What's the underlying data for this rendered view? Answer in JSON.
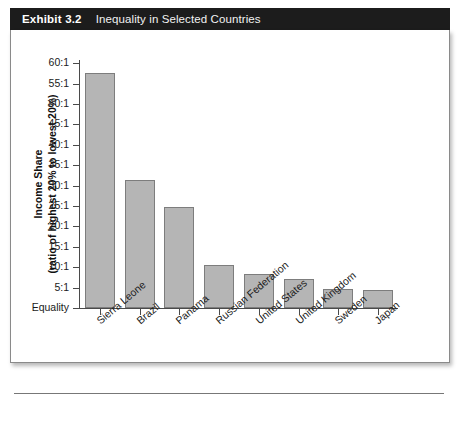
{
  "exhibit": {
    "number": "Exhibit 3.2",
    "title": "Inequality in Selected Countries"
  },
  "chart_data": {
    "type": "bar",
    "title": "Inequality in Selected Countries",
    "xlabel": "",
    "ylabel": "Income Share (ratio of highest 20% to lowest 20%)",
    "ylabel_line1": "Income Share",
    "ylabel_line2": "(ratio of highest 20% to lowest 20%)",
    "categories": [
      "Sierra Leone",
      "Brazil",
      "Panama",
      "Russian Federation",
      "United States",
      "United Kingdom",
      "Sweden",
      "Japan"
    ],
    "values": [
      57.6,
      31.5,
      24.7,
      10.5,
      8.4,
      7.2,
      4.6,
      4.3
    ],
    "ylim": [
      0,
      60
    ],
    "ytick_values": [
      0,
      5,
      10,
      15,
      20,
      25,
      30,
      35,
      40,
      45,
      50,
      55,
      60
    ],
    "ytick_labels": [
      "Equality",
      "5:1",
      "10:1",
      "15:1",
      "20:1",
      "25:1",
      "30:1",
      "35:1",
      "40:1",
      "45:1",
      "50:1",
      "55:1",
      "60:1"
    ],
    "grid": false,
    "legend": null,
    "bar_color": "#b5b5b5",
    "bar_border_color": "#7d7d7d",
    "axis_color": "#4a4a4a"
  }
}
